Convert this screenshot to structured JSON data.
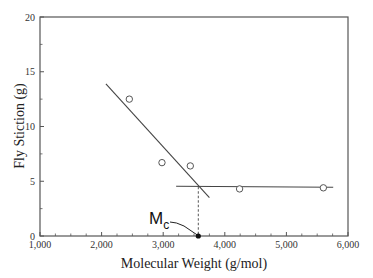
{
  "chart_data": {
    "type": "scatter",
    "title": "",
    "xlabel": "Molecular Weight (g/mol)",
    "ylabel": "Fly Stiction (g)",
    "xlim": [
      1000,
      6000
    ],
    "ylim": [
      0,
      20
    ],
    "grid": false,
    "legend": null,
    "x_ticks": [
      1000,
      2000,
      3000,
      4000,
      5000,
      6000
    ],
    "x_tick_labels": [
      "1,000",
      "2,000",
      "3,000",
      "4,000",
      "5,000",
      "6,000"
    ],
    "y_ticks": [
      0,
      5,
      10,
      15,
      20
    ],
    "y_tick_labels": [
      "0",
      "5",
      "10",
      "15",
      "20"
    ],
    "series": [
      {
        "name": "measured",
        "marker": "open-circle",
        "points": [
          {
            "x": 2450,
            "y": 12.5
          },
          {
            "x": 2980,
            "y": 6.7
          },
          {
            "x": 3440,
            "y": 6.4
          },
          {
            "x": 4240,
            "y": 4.3
          },
          {
            "x": 5600,
            "y": 4.4
          }
        ]
      }
    ],
    "fit_lines": [
      {
        "name": "low-MW fit",
        "from": {
          "x": 2070,
          "y": 13.9
        },
        "to": {
          "x": 3750,
          "y": 3.5
        }
      },
      {
        "name": "high-MW fit",
        "from": {
          "x": 3210,
          "y": 4.55
        },
        "to": {
          "x": 5760,
          "y": 4.45
        }
      }
    ],
    "annotations": [
      {
        "text": "M",
        "subscript": "c",
        "label": "Mc",
        "target": {
          "x": 3570,
          "y": 0
        },
        "dashed_drop_from_y": 4.5,
        "marker": "filled-dot"
      }
    ]
  },
  "labels": {
    "xlabel": "Molecular Weight (g/mol)",
    "ylabel": "Fly Stiction (g)",
    "mc_main": "M",
    "mc_sub": "c"
  }
}
